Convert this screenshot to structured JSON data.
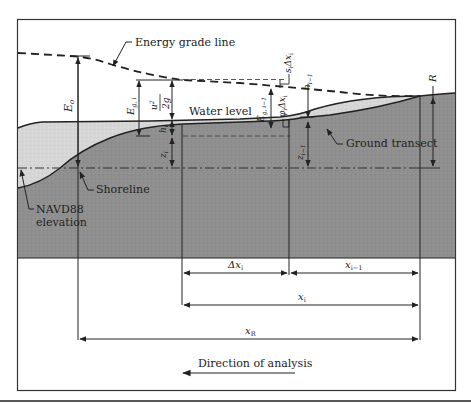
{
  "diagram": {
    "type": "hydraulic-profile-schematic",
    "colors": {
      "ground": "#8f8f8f",
      "water": "#d6d6d6",
      "line": "#222222",
      "frame": "#333333",
      "background": "#ffffff"
    },
    "labels": {
      "energy_grade_line": "Energy grade line",
      "water_level": "Water level",
      "ground_transect": "Ground transect",
      "shoreline": "Shoreline",
      "navd88_line1": "NAVD88",
      "navd88_line2": "elevation",
      "direction": "Direction of analysis"
    },
    "symbols": {
      "E0": "E",
      "E0_sub": "o",
      "Egi": "E",
      "Egi_sub": "g, i",
      "velocity_head_num": "u",
      "velocity_head_num_sup": "2",
      "velocity_head_num_sub": "i",
      "velocity_head_den": "2g",
      "hi": "h",
      "hi_sub": "i",
      "zi": "z",
      "zi_sub": "i",
      "Egi1": "E",
      "Egi1_sub": "g, i−1",
      "phi": "φ",
      "phi_sub": "i",
      "phi_dx": "Δx",
      "phi_dx_sub": "i",
      "s": "s",
      "s_sub": "i",
      "s_dx": "Δx",
      "s_dx_sub": "i",
      "hi1": "h",
      "hi1_sub": "i−1",
      "zi1": "z",
      "zi1_sub": "i−1",
      "R": "R"
    },
    "dimensions": {
      "dx_i": {
        "label": "Δx",
        "sub": "i"
      },
      "x_i_minus_1": {
        "label": "x",
        "sub": "i−1"
      },
      "x_i": {
        "label": "x",
        "sub": "i"
      },
      "x_R": {
        "label": "x",
        "sub": "R"
      }
    }
  }
}
